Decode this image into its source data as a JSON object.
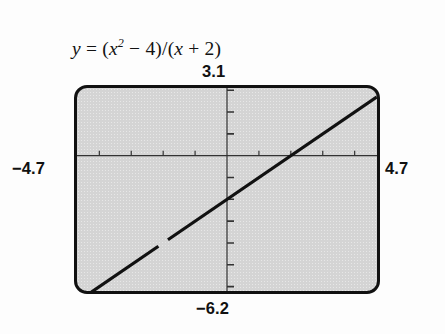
{
  "figure": {
    "name": "graphing-calculator-screen",
    "equation": {
      "lhs": "y",
      "equals": "=",
      "rhs_open": "(",
      "x": "x",
      "exponent": "2",
      "minus": " − 4)/(",
      "x2": "x",
      "plus": " + 2)",
      "full_text": "y = (x² − 4)/(x + 2)"
    },
    "window_labels": {
      "ymax": "3.1",
      "ymin": "−6.2",
      "xmin": "−4.7",
      "xmax": "4.7"
    },
    "colors": {
      "screen_fill": "#d4d4d4",
      "screen_border": "#111111",
      "curve": "#111111",
      "axis": "#333333",
      "page_background": "#fdfdfd",
      "text": "#111111"
    }
  },
  "chart_data": {
    "type": "line",
    "subtitle": "",
    "xlabel": "",
    "ylabel": "",
    "xlim": [
      -4.7,
      4.7
    ],
    "ylim": [
      -6.2,
      3.1
    ],
    "grid": false,
    "legend": "none",
    "axes": {
      "x_axis_at_y": 0,
      "y_axis_at_x": 0,
      "x_tick_interval": 1,
      "y_tick_interval": 1,
      "x_ticks": [
        -4,
        -3,
        -2,
        -1,
        1,
        2,
        3,
        4
      ],
      "y_ticks": [
        -6,
        -5,
        -4,
        -3,
        -2,
        -1,
        1,
        2,
        3
      ],
      "x_tick_labels_shown": false,
      "y_tick_labels_shown": false
    },
    "series": [
      {
        "name": "y = (x^2 - 4)/(x + 2)",
        "simplified": "y = x - 2",
        "x": [
          -4.7,
          -2.0,
          -2.0,
          4.7
        ],
        "values": [
          -6.7,
          -4.0,
          -4.0,
          2.7
        ],
        "segments": [
          {
            "x": [
              -4.7,
              -2.15
            ],
            "y": [
              -6.7,
              -4.15
            ]
          },
          {
            "x": [
              -1.85,
              4.7
            ],
            "y": [
              -3.85,
              2.7
            ]
          }
        ],
        "discontinuity": {
          "x": -2,
          "y": -4,
          "kind": "removable-hole"
        },
        "style": "solid",
        "width_px": 3.2,
        "color": "#111111"
      }
    ],
    "annotations": [
      {
        "text": "3.1",
        "position": "top-center",
        "role": "y-max window value"
      },
      {
        "text": "−6.2",
        "position": "bottom-center",
        "role": "y-min window value"
      },
      {
        "text": "−4.7",
        "position": "left-middle",
        "role": "x-min window value"
      },
      {
        "text": "4.7",
        "position": "right-middle",
        "role": "x-max window value"
      }
    ]
  }
}
